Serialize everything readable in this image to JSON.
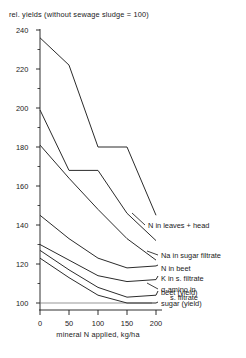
{
  "chart_data": {
    "type": "line",
    "title": "rel. yields (without sewage sludge = 100)",
    "xlabel": "mineral N applied, kg/ha",
    "ylabel": "",
    "x": [
      0,
      50,
      100,
      150,
      200
    ],
    "xlim": [
      0,
      200
    ],
    "ylim": [
      100,
      240
    ],
    "xticks": [
      "0",
      "50",
      "100",
      "150",
      "200"
    ],
    "yticks": [
      "240",
      "220",
      "200",
      "180",
      "160",
      "140",
      "120",
      "100"
    ],
    "grid": false,
    "legend_position": "inline-right-labels",
    "series": [
      {
        "name": "N in leaves + head",
        "values": [
          236,
          222,
          180,
          180,
          145
        ]
      },
      {
        "name": "Na in sugar filtrate",
        "values": [
          199,
          168,
          168,
          146,
          132
        ]
      },
      {
        "name": "α-amino in",
        "name2": "s. filtrate",
        "values": [
          181,
          164,
          148,
          133,
          122
        ]
      },
      {
        "name": "N in beet",
        "values": [
          145,
          133,
          123,
          118,
          119
        ]
      },
      {
        "name": "K in s. filtrate",
        "values": [
          130,
          122,
          114,
          111,
          112
        ]
      },
      {
        "name": "beet (yield)",
        "values": [
          127,
          117,
          108,
          103,
          104
        ]
      },
      {
        "name": "sugar (yield)",
        "values": [
          123,
          113,
          104,
          100,
          100
        ]
      }
    ],
    "reference_line": 100
  },
  "labels": {
    "title": "rel. yields (without sewage sludge = 100)",
    "xaxis": "mineral N applied, kg/ha",
    "y240": "240",
    "y220": "220",
    "y200": "200",
    "y180": "180",
    "y160": "160",
    "y140": "140",
    "y120": "120",
    "y100": "100",
    "x0": "0",
    "x50": "50",
    "x100": "100",
    "x150": "150",
    "x200": "200",
    "s1": "N in leaves + head",
    "s2": "Na in sugar filtrate",
    "s3a": "α-amino in",
    "s3b": "s. filtrate",
    "s4": "N in beet",
    "s5": "K in s. filtrate",
    "s6": "beet (yield)",
    "s7": "sugar (yield)"
  },
  "colors": {
    "ink": "#1a1a1a",
    "curve": "#2b2b2b",
    "baseline": "#6a6a6a",
    "background": "#ffffff"
  }
}
